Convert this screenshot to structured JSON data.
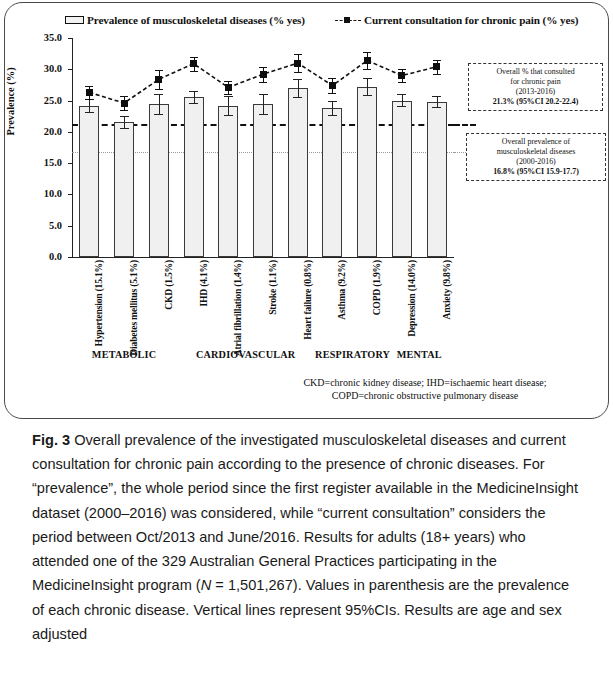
{
  "legend": {
    "bar_series_label": "Prevalence of musculoskeletal diseases (% yes)",
    "line_series_label": "Current consultation for chronic pain (% yes)"
  },
  "axes": {
    "y_title": "Prevalence (%)",
    "y_ticks": [
      "35.0",
      "30.0",
      "25.0",
      "20.0",
      "15.0",
      "10.0",
      "5.0",
      "0.0"
    ]
  },
  "groups": [
    {
      "label": "METABOLIC",
      "start": 0,
      "end": 2
    },
    {
      "label": "CARDIOVASCULAR",
      "start": 3,
      "end": 6
    },
    {
      "label": "RESPIRATORY",
      "start": 7,
      "end": 8
    },
    {
      "label": "MENTAL",
      "start": 9,
      "end": 10
    }
  ],
  "callouts": {
    "consultation": {
      "line1": "Overall % that consulted",
      "line2": "for chronic pain",
      "line3": "(2013-2016)",
      "line4": "21.3% (95%CI 20.2-22.4)"
    },
    "prevalence": {
      "line1": "Overall prevalence of",
      "line2": "musculoskeletal diseases",
      "line3": "(2000-2016)",
      "line4": "16.8% (95%CI 15.9-17.7)"
    }
  },
  "abbreviations": {
    "line1": "CKD=chronic kidney disease; IHD=ischaemic heart disease;",
    "line2": "COPD=chronic obstructive pulmonary disease"
  },
  "caption": {
    "figure_number": "Fig. 3",
    "text": " Overall prevalence of the investigated musculoskeletal diseases and current consultation for chronic pain according to the presence of chronic diseases. For “prevalence”, the whole period since the first register available in the MedicineInsight dataset (2000–2016) was considered, while “current consultation” considers the period between Oct/2013 and June/2016. Results for adults (18+ years) who attended one of the 329 Australian General Practices participating in the MedicineInsight program (",
    "n_italic": "N",
    "n_value": " = 1,501,267). Values in parenthesis are the prevalence of each chronic disease. Vertical lines represent 95%CIs. Results are age and sex adjusted"
  },
  "chart_data": {
    "type": "bar",
    "title": "Overall prevalence of the investigated musculoskeletal diseases and current consultation for chronic pain according to the presence of chronic diseases",
    "xlabel": "",
    "ylabel": "Prevalence (%)",
    "ylim": [
      0.0,
      35.0
    ],
    "ytick_step": 5.0,
    "grid": false,
    "legend_position": "top",
    "categories": [
      "Hypertension (15.1%)",
      "Diabetes mellitus (5.1%)",
      "CKD (1.5%)",
      "IHD (4.1%)",
      "Atrial fibrillation (1.4%)",
      "Stroke (1.1%)",
      "Heart failure (0.8%)",
      "Asthma (9.2%)",
      "COPD (1.9%)",
      "Depression (14.0%)",
      "Anxiety (9.8%)"
    ],
    "series": [
      {
        "name": "Prevalence of musculoskeletal diseases (% yes)",
        "type": "bar",
        "values": [
          24.2,
          21.5,
          24.5,
          25.6,
          24.2,
          24.5,
          27.0,
          23.8,
          27.2,
          25.0,
          24.8
        ],
        "ci_low": [
          23.2,
          20.6,
          22.9,
          24.6,
          22.7,
          22.9,
          25.6,
          22.7,
          25.9,
          24.1,
          23.9
        ],
        "ci_high": [
          25.2,
          22.5,
          26.1,
          26.6,
          25.7,
          26.1,
          28.5,
          24.9,
          28.6,
          26.0,
          25.8
        ]
      },
      {
        "name": "Current consultation for chronic pain (% yes)",
        "type": "line",
        "values": [
          26.3,
          24.6,
          28.4,
          30.9,
          27.1,
          29.2,
          31.0,
          27.4,
          31.4,
          29.0,
          30.4
        ],
        "ci_low": [
          25.3,
          23.5,
          26.9,
          29.8,
          26.0,
          28.0,
          29.6,
          26.2,
          30.1,
          28.0,
          29.3
        ],
        "ci_high": [
          27.4,
          25.7,
          29.9,
          32.0,
          28.2,
          30.4,
          32.4,
          28.6,
          32.7,
          30.0,
          31.5
        ]
      }
    ],
    "reference_lines": [
      {
        "name": "Overall % that consulted for chronic pain (2013-2016)",
        "value": 21.3,
        "style": "dashed"
      },
      {
        "name": "Overall prevalence of musculoskeletal diseases (2000-2016)",
        "value": 16.8,
        "style": "dotted"
      }
    ]
  }
}
